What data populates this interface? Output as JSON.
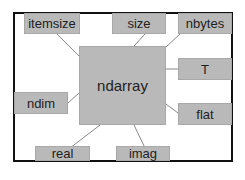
{
  "diagram": {
    "center": {
      "label": "ndarray"
    },
    "attributes": [
      {
        "label": "itemsize"
      },
      {
        "label": "size"
      },
      {
        "label": "nbytes"
      },
      {
        "label": "T"
      },
      {
        "label": "ndim"
      },
      {
        "label": "flat"
      },
      {
        "label": "real"
      },
      {
        "label": "imag"
      }
    ],
    "colors": {
      "box_fill": "#b9b9b9",
      "frame": "#111111",
      "connector": "#888888"
    }
  }
}
